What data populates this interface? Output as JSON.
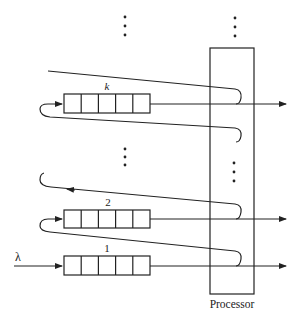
{
  "diagram": {
    "arrival_label": "λ",
    "processor_label": "Processor",
    "queues": [
      {
        "label": "k",
        "cells": 5
      },
      {
        "label": "2",
        "cells": 5
      },
      {
        "label": "1",
        "cells": 5
      }
    ],
    "ellipsis": "⋮",
    "colors": {
      "stroke": "#222222",
      "background": "#ffffff"
    }
  }
}
